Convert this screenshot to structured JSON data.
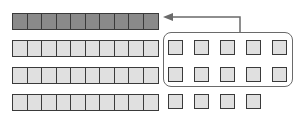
{
  "diagram": {
    "colors": {
      "filled_cell": "#8a8a8a",
      "empty_cell": "#e0e0e0",
      "border": "#3a3a3a",
      "group_outline": "#6a6a6a",
      "arrow": "#6a6a6a"
    },
    "bars": [
      {
        "id": "row-1",
        "cells": 10,
        "style": "filled",
        "top": 13
      },
      {
        "id": "row-2",
        "cells": 10,
        "style": "empty",
        "top": 40
      },
      {
        "id": "row-3",
        "cells": 10,
        "style": "empty",
        "top": 67
      },
      {
        "id": "row-4",
        "cells": 10,
        "style": "empty",
        "top": 94
      }
    ],
    "loose_squares": [
      {
        "row": 2,
        "count": 5,
        "top": 40,
        "grouped": true
      },
      {
        "row": 3,
        "count": 5,
        "top": 67,
        "grouped": true
      },
      {
        "row": 4,
        "count": 4,
        "top": 94,
        "grouped": false
      }
    ],
    "group": {
      "squares": 10,
      "label": ""
    },
    "arrow": {
      "from": "group",
      "to": "row-1",
      "direction": "left"
    }
  }
}
